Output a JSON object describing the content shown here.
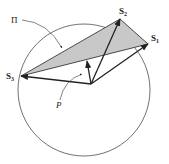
{
  "diagram": {
    "colors": {
      "stroke": "#222222",
      "fill_triangle": "#c8c8c8",
      "background": "#ffffff"
    },
    "circle": {
      "cx": 84,
      "cy": 90,
      "r": 66
    },
    "origin": {
      "x": 91,
      "y": 84
    },
    "points": {
      "S1": {
        "x": 148,
        "y": 44,
        "label": "S",
        "sub": "1"
      },
      "S2": {
        "x": 120,
        "y": 19,
        "label": "S",
        "sub": "2"
      },
      "S3": {
        "x": 21,
        "y": 76,
        "label": "S",
        "sub": "3"
      }
    },
    "P_vector_tip": {
      "x": 87,
      "y": 61
    },
    "labels": {
      "plane": "Π",
      "point_P": "P"
    }
  }
}
